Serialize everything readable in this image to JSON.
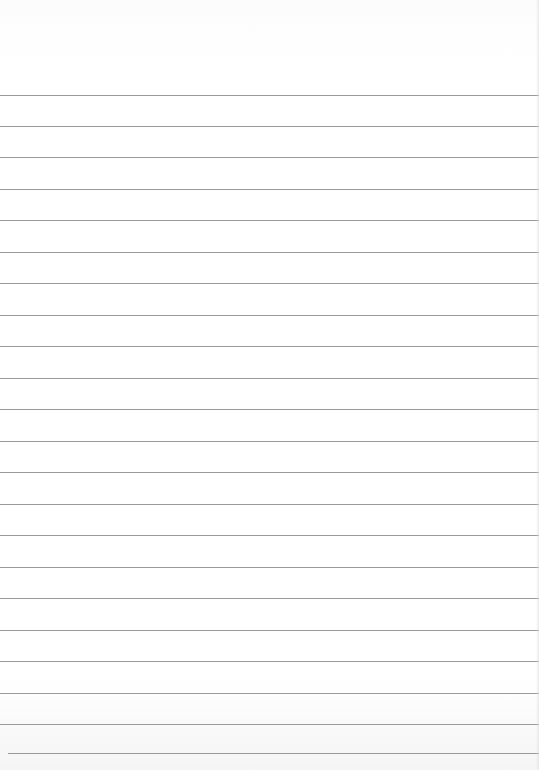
{
  "page": {
    "type": "lined-paper",
    "background_color": "#ffffff",
    "rule_color": "#9a9a9a",
    "rule_count": 22,
    "first_rule_y": 95,
    "rule_spacing_px": 31.4,
    "rules_y": [
      95,
      126,
      157,
      189,
      220,
      252,
      283,
      315,
      346,
      378,
      409,
      441,
      472,
      504,
      535,
      567,
      598,
      630,
      661,
      693,
      724,
      753
    ],
    "text_content": []
  }
}
